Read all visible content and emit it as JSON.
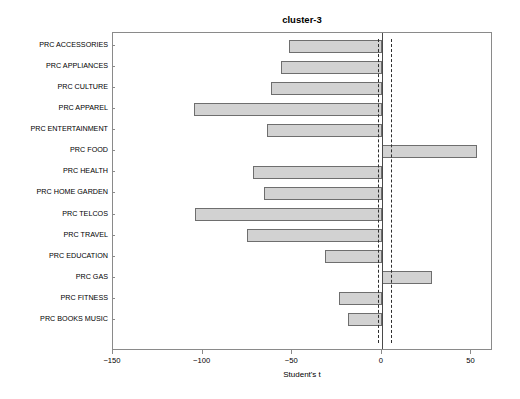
{
  "chart_data": {
    "type": "bar",
    "orientation": "horizontal",
    "title": "cluster-3",
    "xlabel": "Student's t",
    "ylabel": "",
    "xlim": [
      -150,
      62
    ],
    "xticks": [
      -150,
      -100,
      -50,
      0,
      50
    ],
    "xtick_labels": [
      "−150",
      "−100",
      "−50",
      "0",
      "50"
    ],
    "grid": false,
    "legend": null,
    "reference_lines": [
      {
        "name": "zero-line",
        "value": 0,
        "style": "solid"
      },
      {
        "name": "significance-line-negative",
        "value": -2,
        "style": "dashed"
      },
      {
        "name": "significance-line-positive",
        "value": 5,
        "style": "dashed"
      }
    ],
    "categories": [
      "PRC ACCESSORIES",
      "PRC APPLIANCES",
      "PRC CULTURE",
      "PRC APPAREL",
      "PRC ENTERTAINMENT",
      "PRC FOOD",
      "PRC HEALTH",
      "PRC HOME GARDEN",
      "PRC TELCOS",
      "PRC TRAVEL",
      "PRC EDUCATION",
      "PRC GAS",
      "PRC FITNESS",
      "PRC BOOKS MUSIC"
    ],
    "values": [
      -52,
      -56,
      -62,
      -105,
      -64,
      53,
      -72,
      -66,
      -104,
      -75,
      -32,
      28,
      -24,
      -19
    ],
    "bar_fill_color": "#d2d2d2",
    "bar_edge_color": "#6e6e6e"
  }
}
